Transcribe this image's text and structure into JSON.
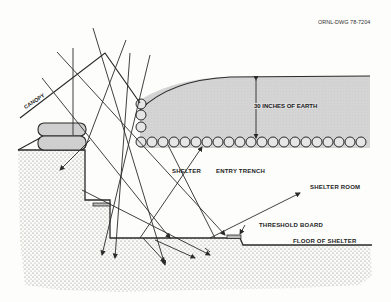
{
  "drawing_id": "ORNL-DWG 78-7204",
  "labels": {
    "canopy": "CANOPY",
    "earth_depth": "30 INCHES OF EARTH",
    "shelter": "SHELTER",
    "entry_trench": "ENTRY TRENCH",
    "shelter_room": "SHELTER ROOM",
    "threshold_board": "THRESHOLD BOARD",
    "floor_of_shelter": "FLOOR OF SHELTER"
  },
  "colors": {
    "earth_fill": "#d6d6d6",
    "ground_stipple": "#8a8a8a",
    "line": "#2a2a2a",
    "background": "#fdfdfb"
  }
}
